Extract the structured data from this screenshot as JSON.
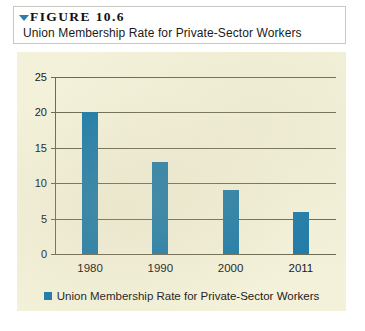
{
  "figure": {
    "marker_icon": "triangle-down-icon",
    "number_label": "FIGURE 10.6",
    "caption": "Union Membership Rate for Private-Sector Workers"
  },
  "colors": {
    "bar": "#1d7aa8",
    "panel_background": "#f4f1da",
    "gridline": "#6d6a52",
    "marker_triangle": "#2a7fa8"
  },
  "chart_data": {
    "type": "bar",
    "title": "Union Membership Rate for Private-Sector Workers",
    "xlabel": "",
    "ylabel": "",
    "categories": [
      "1980",
      "1990",
      "2000",
      "2011"
    ],
    "values": [
      20,
      13,
      9,
      6
    ],
    "series": [
      {
        "name": "Union Membership Rate for Private-Sector Workers",
        "values": [
          20,
          13,
          9,
          6
        ],
        "color": "#1d7aa8"
      }
    ],
    "ylim": [
      0,
      25
    ],
    "ytick_step": 5,
    "yticks": [
      0,
      5,
      10,
      15,
      20,
      25
    ],
    "ytick_labels": [
      "0",
      "5",
      "10",
      "15",
      "20",
      "25"
    ],
    "grid": true,
    "grid_axis": "y",
    "legend_position": "bottom",
    "legend_entries": [
      "Union Membership Rate for Private-Sector Workers"
    ]
  }
}
